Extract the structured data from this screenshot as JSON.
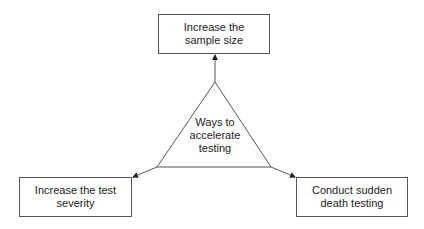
{
  "diagram": {
    "center": {
      "label": "Ways to accelerate testing",
      "lines": [
        "Ways to",
        "accelerate",
        "testing"
      ]
    },
    "nodes": [
      {
        "id": "top",
        "label": "Increase the sample size"
      },
      {
        "id": "left",
        "label": "Increase the test severity"
      },
      {
        "id": "right",
        "label": "Conduct sudden death testing"
      }
    ],
    "edges": [
      {
        "from": "center",
        "to": "top"
      },
      {
        "from": "center",
        "to": "left"
      },
      {
        "from": "center",
        "to": "right"
      }
    ],
    "colors": {
      "line": "#555555",
      "text": "#222222",
      "background": "#ffffff"
    }
  }
}
